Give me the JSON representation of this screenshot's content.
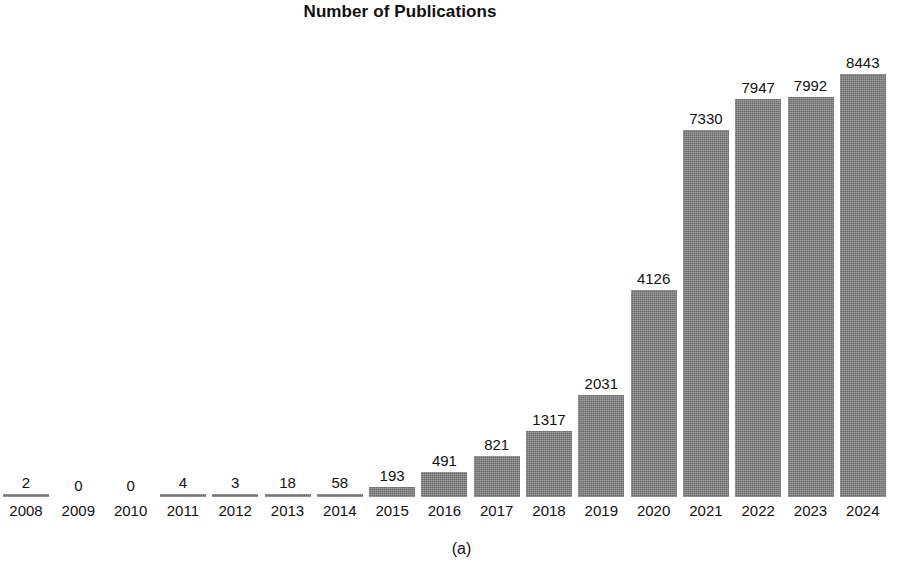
{
  "chart_data": {
    "type": "bar",
    "title": "Number of Publications",
    "xlabel": "",
    "ylabel": "",
    "categories": [
      "2008",
      "2009",
      "2010",
      "2011",
      "2012",
      "2013",
      "2014",
      "2015",
      "2016",
      "2017",
      "2018",
      "2019",
      "2020",
      "2021",
      "2022",
      "2023",
      "2024"
    ],
    "values": [
      2,
      0,
      0,
      4,
      3,
      18,
      58,
      193,
      491,
      821,
      1317,
      2031,
      4126,
      7330,
      7947,
      7992,
      8443
    ],
    "value_labels": [
      "2",
      "0",
      "0",
      "4",
      "3",
      "18",
      "58",
      "193",
      "491",
      "821",
      "1317",
      "2031",
      "4126",
      "7330",
      "7947",
      "7992",
      "8443"
    ],
    "ylim": [
      0,
      8443
    ],
    "grid": false,
    "legend": null,
    "bar_color": "#858585",
    "text_color": "#111111",
    "background_color": "#ffffff"
  },
  "caption": {
    "text": "(a)"
  }
}
